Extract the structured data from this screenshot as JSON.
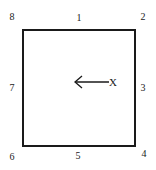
{
  "diagram": {
    "positions": [
      {
        "id": "1",
        "label": "1",
        "location": "top-center"
      },
      {
        "id": "2",
        "label": "2",
        "location": "top-right"
      },
      {
        "id": "3",
        "label": "3",
        "location": "right-center"
      },
      {
        "id": "4",
        "label": "4",
        "location": "bottom-right"
      },
      {
        "id": "5",
        "label": "5",
        "location": "bottom-center"
      },
      {
        "id": "6",
        "label": "6",
        "location": "bottom-left"
      },
      {
        "id": "7",
        "label": "7",
        "location": "left-center"
      },
      {
        "id": "8",
        "label": "8",
        "location": "top-left"
      }
    ],
    "marker": {
      "label": "X",
      "arrow_direction": "left"
    },
    "colors": {
      "stroke": "#1a1a1a",
      "background": "#ffffff"
    }
  }
}
